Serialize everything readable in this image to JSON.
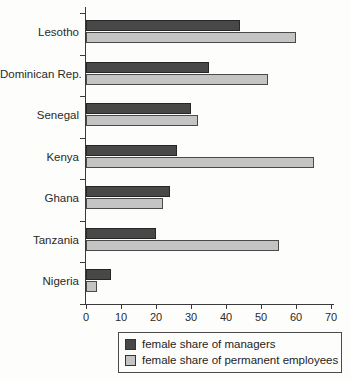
{
  "chart_data": {
    "type": "bar",
    "orientation": "horizontal",
    "title": "",
    "xlabel": "",
    "ylabel": "",
    "categories": [
      "Lesotho",
      "Dominican Rep.",
      "Senegal",
      "Kenya",
      "Ghana",
      "Tanzania",
      "Nigeria"
    ],
    "series": [
      {
        "name": "female share of managers",
        "color": "#484848",
        "border_color": "#262626",
        "values": [
          44,
          35,
          30,
          26,
          24,
          20,
          7
        ]
      },
      {
        "name": "female share of permanent employees",
        "color": "#c4c4c4",
        "border_color": "#4a4a4a",
        "values": [
          60,
          52,
          32,
          65,
          22,
          55,
          3
        ]
      }
    ],
    "xlim": [
      0,
      70
    ],
    "x_ticks": [
      "0",
      "10",
      "20",
      "30",
      "40",
      "50",
      "60",
      "70"
    ],
    "grid": false,
    "legend_position": "bottom"
  },
  "colors": {
    "background": "#fdfdfc",
    "axis": "#3a3a3a",
    "text": "#2a2a2a"
  }
}
